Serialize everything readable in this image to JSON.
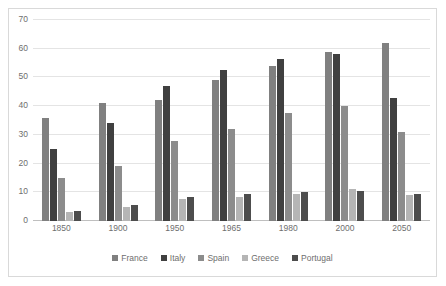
{
  "chart_data": {
    "type": "bar",
    "title": "",
    "subtitle": "",
    "xlabel": "",
    "ylabel": "",
    "categories": [
      "1850",
      "1900",
      "1950",
      "1965",
      "1980",
      "2000",
      "2050"
    ],
    "ylim": [
      0,
      70
    ],
    "yticks": [
      0,
      10,
      20,
      30,
      40,
      50,
      60,
      70
    ],
    "ytick_labels": [
      "0",
      "10",
      "20",
      "30",
      "40",
      "50",
      "60",
      "70"
    ],
    "grid": true,
    "legend_position": "bottom",
    "series": [
      {
        "name": "France",
        "color": "#808080",
        "values": [
          36,
          41,
          42,
          49,
          54,
          59,
          62
        ]
      },
      {
        "name": "Italy",
        "color": "#404040",
        "values": [
          25,
          34,
          47,
          52.5,
          56.5,
          58,
          43
        ]
      },
      {
        "name": "Spain",
        "color": "#8c8c8c",
        "values": [
          15,
          19,
          28,
          32,
          37.5,
          40,
          31
        ]
      },
      {
        "name": "Greece",
        "color": "#b5b5b5",
        "values": [
          3,
          5,
          7.5,
          8.5,
          9.5,
          11,
          9
        ]
      },
      {
        "name": "Portugal",
        "color": "#4d4d4d",
        "values": [
          3.5,
          5.5,
          8.5,
          9.5,
          10,
          10.5,
          9.5
        ]
      }
    ]
  }
}
